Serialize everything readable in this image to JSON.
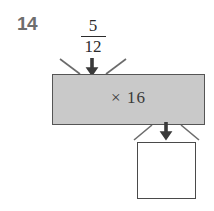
{
  "page": {
    "background_color": "#ffffff",
    "width": 214,
    "height": 211
  },
  "problem": {
    "number": "14"
  },
  "machine": {
    "input": {
      "type": "fraction",
      "numerator": "5",
      "denominator": "12",
      "display": "5/12"
    },
    "operation": {
      "label": "× 16",
      "symbol": "×",
      "operand": "16",
      "fill_color": "#c9c9c9",
      "border_color": "#555555"
    },
    "output": {
      "value": "",
      "placeholder": "",
      "fill_color": "#ffffff",
      "border_color": "#4a4a4a"
    },
    "arrows": {
      "input_arrow": "down-arrow-icon",
      "output_arrow": "down-arrow-icon",
      "color": "#3a3a3a"
    },
    "ticks": {
      "color": "#6b6b6b"
    }
  }
}
